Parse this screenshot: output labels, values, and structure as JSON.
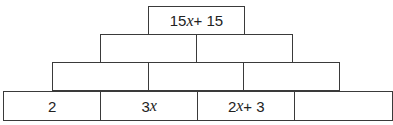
{
  "pyramid": {
    "rows": [
      {
        "cells": [
          {
            "text": "15x + 15"
          }
        ]
      },
      {
        "cells": [
          {
            "text": ""
          },
          {
            "text": ""
          }
        ]
      },
      {
        "cells": [
          {
            "text": ""
          },
          {
            "text": ""
          },
          {
            "text": ""
          }
        ]
      },
      {
        "cells": [
          {
            "text": "2"
          },
          {
            "text": "3x"
          },
          {
            "text": "2x + 3"
          },
          {
            "text": ""
          }
        ]
      }
    ]
  },
  "colors": {
    "border": "#3a3a3a",
    "text": "#222222",
    "background": "#ffffff"
  }
}
